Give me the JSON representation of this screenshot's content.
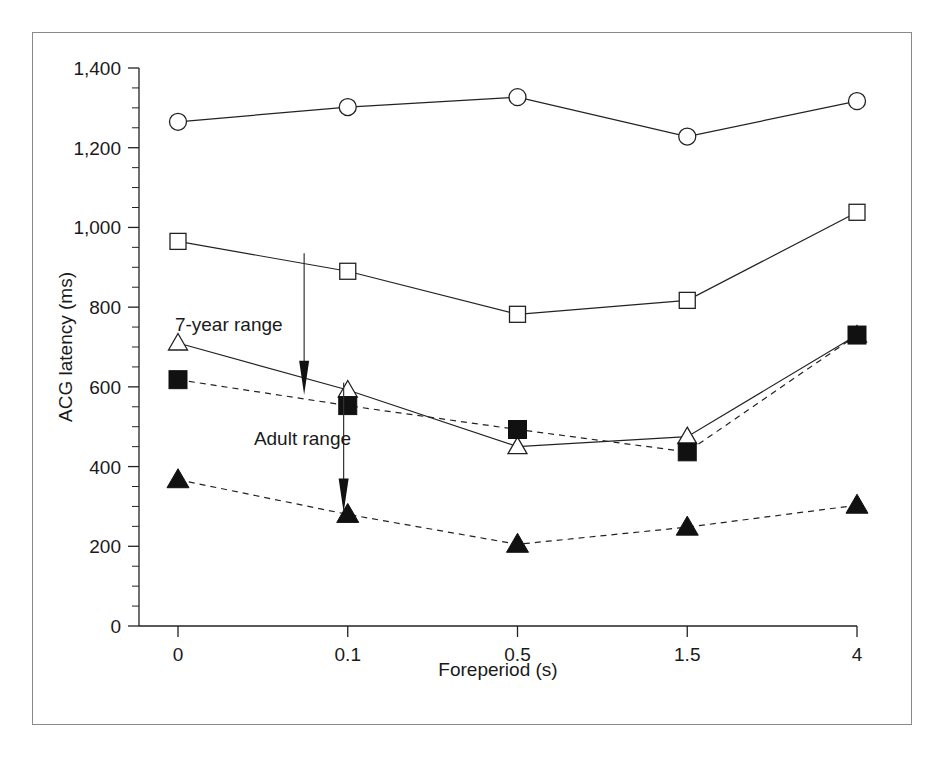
{
  "figure": {
    "frame_visible": true,
    "background_color": "#ffffff",
    "ink_color": "#222222"
  },
  "chart_data": {
    "type": "line",
    "title": "",
    "xlabel": "Foreperiod (s)",
    "ylabel": "ACG latency (ms)",
    "categories": [
      "0",
      "0.1",
      "0.5",
      "1.5",
      "4"
    ],
    "ylim": [
      0,
      1400
    ],
    "ytick_step": 200,
    "yminor_step": 50,
    "grid": false,
    "legend_position": "none",
    "ytick_labels": [
      "0",
      "200",
      "400",
      "600",
      "800",
      "1,000",
      "1,200",
      "1,400"
    ],
    "ytick_values": [
      0,
      200,
      400,
      600,
      800,
      1000,
      1200,
      1400
    ],
    "series": [
      {
        "name": "open-circle-series",
        "marker": "open-circle",
        "linestyle": "solid",
        "values": [
          1265,
          1302,
          1327,
          1228,
          1317
        ]
      },
      {
        "name": "open-square-series",
        "marker": "open-square",
        "linestyle": "solid",
        "values": [
          965,
          890,
          782,
          817,
          1038
        ]
      },
      {
        "name": "open-triangle-series",
        "marker": "open-triangle",
        "linestyle": "solid",
        "values": [
          710,
          592,
          450,
          475,
          730
        ]
      },
      {
        "name": "filled-square-series",
        "marker": "filled-square",
        "linestyle": "dashed",
        "values": [
          618,
          553,
          493,
          437,
          730
        ]
      },
      {
        "name": "filled-triangle-series",
        "marker": "filled-triangle",
        "linestyle": "dashed",
        "values": [
          367,
          280,
          205,
          248,
          303
        ]
      }
    ],
    "annotations": [
      {
        "name": "seven-year-range",
        "text": "7-year range",
        "text_x": "0.05",
        "text_y": 740,
        "arrow_from": 935,
        "arrow_to": 595,
        "arrow_x_frac": 0.23
      },
      {
        "name": "adult-range",
        "text": "Adult range",
        "text_x": "0.16",
        "text_y": 455,
        "arrow_from": 610,
        "arrow_to": 300,
        "arrow_x_frac": 0.285
      }
    ]
  }
}
